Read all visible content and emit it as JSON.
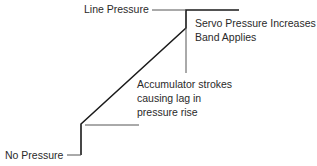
{
  "diagram": {
    "labels": {
      "line_pressure": "Line Pressure",
      "servo_line1": "Servo Pressure Increases",
      "servo_line2": "Band Applies",
      "accumulator_line1": "Accumulator strokes",
      "accumulator_line2": "causing lag in",
      "accumulator_line3": "pressure rise",
      "no_pressure": "No Pressure"
    },
    "colors": {
      "stroke": "#1a1a1a",
      "leader": "#555555",
      "text": "#2a2a2a",
      "background": "#ffffff"
    },
    "curve_points": [
      [
        81,
        155
      ],
      [
        81,
        124
      ],
      [
        186,
        28
      ],
      [
        186,
        10
      ],
      [
        239,
        10
      ]
    ]
  }
}
